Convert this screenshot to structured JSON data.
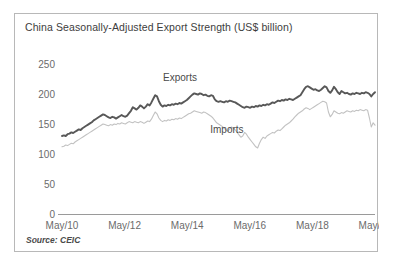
{
  "figure": {
    "title": "China Seasonally-Adjusted Export Strength (US$ billion)",
    "source": "Source: CEIC"
  },
  "chart_data": {
    "type": "line",
    "title": "China Seasonally-Adjusted Export Strength (US$ billion)",
    "subtitle": "",
    "xlabel": "",
    "ylabel": "",
    "source": "Source: CEIC",
    "grid": false,
    "legend_position": "inline-annotation",
    "ylim": [
      0,
      250
    ],
    "yticks": [
      0,
      50,
      100,
      150,
      200,
      250
    ],
    "ytick_labels": [
      "0",
      "50",
      "100",
      "150",
      "200",
      "250"
    ],
    "xlim": [
      "May/10",
      "May/20"
    ],
    "xticks": [
      "May/10",
      "May/12",
      "May/14",
      "May/16",
      "May/18",
      "May/20"
    ],
    "x_start_year": 2010.33,
    "x_end_year": 2020.33,
    "annotations": [
      {
        "text": "Exports",
        "x": 2014.1,
        "y": 222
      },
      {
        "text": "Imports",
        "x": 2015.6,
        "y": 135
      }
    ],
    "series": [
      {
        "name": "Exports",
        "color": "#585858",
        "width": 1.9,
        "values": [
          130,
          131,
          130,
          133,
          134,
          136,
          135,
          137,
          139,
          141,
          140,
          143,
          145,
          147,
          149,
          151,
          153,
          156,
          158,
          160,
          162,
          164,
          166,
          165,
          163,
          161,
          160,
          162,
          161,
          159,
          161,
          163,
          165,
          163,
          162,
          164,
          168,
          172,
          178,
          176,
          174,
          177,
          181,
          179,
          176,
          179,
          183,
          181,
          186,
          192,
          198,
          196,
          188,
          182,
          179,
          181,
          180,
          182,
          181,
          183,
          182,
          184,
          183,
          185,
          184,
          186,
          188,
          190,
          193,
          196,
          199,
          201,
          200,
          199,
          201,
          200,
          198,
          199,
          197,
          196,
          198,
          197,
          191,
          188,
          187,
          188,
          187,
          186,
          188,
          187,
          189,
          188,
          187,
          186,
          184,
          182,
          180,
          178,
          177,
          179,
          178,
          177,
          179,
          178,
          180,
          179,
          181,
          180,
          182,
          181,
          183,
          182,
          184,
          186,
          185,
          187,
          189,
          188,
          190,
          189,
          191,
          190,
          192,
          191,
          190,
          192,
          194,
          196,
          198,
          203,
          208,
          212,
          213,
          211,
          209,
          207,
          208,
          206,
          205,
          207,
          210,
          213,
          211,
          205,
          202,
          206,
          212,
          208,
          203,
          200,
          205,
          203,
          201,
          202,
          200,
          199,
          201,
          200,
          202,
          201,
          200,
          202,
          201,
          203,
          202,
          200,
          196,
          200,
          203
        ]
      },
      {
        "name": "Imports",
        "color": "#c2c2c2",
        "width": 1.1,
        "values": [
          112,
          113,
          115,
          114,
          116,
          118,
          117,
          120,
          122,
          124,
          126,
          128,
          130,
          132,
          134,
          136,
          138,
          140,
          142,
          144,
          146,
          148,
          150,
          149,
          148,
          147,
          149,
          148,
          150,
          149,
          151,
          150,
          152,
          151,
          150,
          152,
          154,
          153,
          152,
          154,
          153,
          152,
          154,
          153,
          151,
          153,
          155,
          154,
          158,
          164,
          170,
          167,
          160,
          156,
          154,
          156,
          155,
          157,
          156,
          158,
          157,
          159,
          158,
          160,
          159,
          161,
          163,
          165,
          167,
          168,
          170,
          172,
          171,
          170,
          169,
          168,
          170,
          169,
          167,
          165,
          163,
          160,
          156,
          152,
          150,
          148,
          146,
          143,
          140,
          138,
          142,
          145,
          143,
          140,
          136,
          132,
          128,
          130,
          136,
          133,
          128,
          124,
          120,
          116,
          112,
          110,
          118,
          124,
          128,
          126,
          130,
          132,
          134,
          136,
          135,
          138,
          140,
          139,
          142,
          145,
          148,
          150,
          152,
          155,
          158,
          162,
          165,
          168,
          170,
          172,
          175,
          177,
          176,
          174,
          176,
          178,
          180,
          182,
          184,
          186,
          188,
          187,
          185,
          170,
          162,
          166,
          172,
          170,
          168,
          167,
          169,
          168,
          170,
          172,
          171,
          170,
          172,
          171,
          173,
          172,
          174,
          173,
          172,
          174,
          173,
          160,
          145,
          152,
          148
        ]
      }
    ]
  }
}
